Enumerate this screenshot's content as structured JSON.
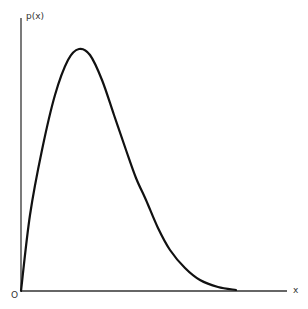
{
  "chart_data": {
    "type": "line",
    "title": "",
    "xlabel": "x",
    "ylabel": "p(x)",
    "origin_label": "O",
    "grid": false,
    "legend": null,
    "series": [
      {
        "name": "p(x)",
        "points_px": [
          [
            21,
            291
          ],
          [
            30,
            215
          ],
          [
            42,
            150
          ],
          [
            55,
            95
          ],
          [
            68,
            60
          ],
          [
            79,
            49
          ],
          [
            90,
            55
          ],
          [
            102,
            80
          ],
          [
            114,
            115
          ],
          [
            126,
            150
          ],
          [
            136,
            178
          ],
          [
            146,
            200
          ],
          [
            158,
            228
          ],
          [
            170,
            250
          ],
          [
            185,
            268
          ],
          [
            200,
            280
          ],
          [
            218,
            287
          ],
          [
            236,
            290
          ]
        ]
      }
    ]
  },
  "labels": {
    "y_axis": "p(x)",
    "x_axis": "x",
    "origin": "O"
  }
}
